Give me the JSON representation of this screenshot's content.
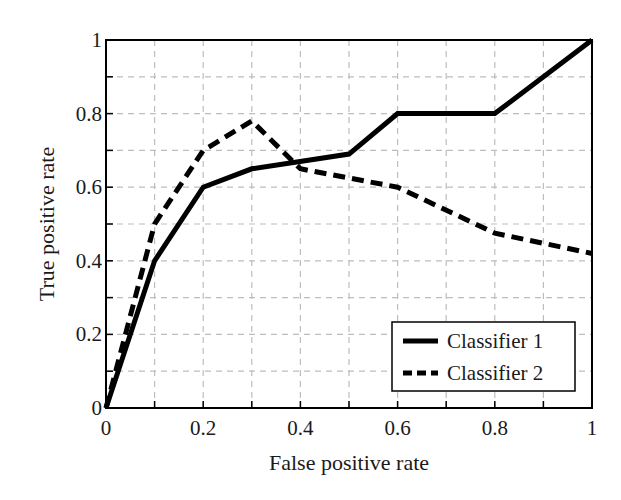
{
  "chart_data": {
    "type": "line",
    "title": "",
    "xlabel": "False positive rate",
    "ylabel": "True positive rate",
    "xlim": [
      0,
      1
    ],
    "ylim": [
      0,
      1
    ],
    "grid": true,
    "grid_step": 0.1,
    "legend_position": "lower right",
    "xticks": [
      0,
      0.2,
      0.4,
      0.6,
      0.8,
      1
    ],
    "xtick_labels": [
      "0",
      "0.2",
      "0.4",
      "0.6",
      "0.8",
      "1"
    ],
    "yticks": [
      0,
      0.2,
      0.4,
      0.6,
      0.8,
      1
    ],
    "ytick_labels": [
      "0",
      "0.2",
      "0.4",
      "0.6",
      "0.8",
      "1"
    ],
    "series": [
      {
        "name": "Classifier 1",
        "style": "solid",
        "color": "#000000",
        "x": [
          0,
          0.1,
          0.2,
          0.3,
          0.5,
          0.6,
          0.8,
          1.0
        ],
        "y": [
          0,
          0.4,
          0.6,
          0.65,
          0.69,
          0.8,
          0.8,
          1.0
        ]
      },
      {
        "name": "Classifier 2",
        "style": "dashed",
        "color": "#000000",
        "x": [
          0,
          0.1,
          0.2,
          0.3,
          0.4,
          0.5,
          0.6,
          0.8,
          1.0
        ],
        "y": [
          0,
          0.5,
          0.7,
          0.78,
          0.65,
          0.625,
          0.6,
          0.475,
          0.42
        ]
      }
    ]
  },
  "colors": {
    "axis": "#000000",
    "grid": "#bdbdbd",
    "background": "#ffffff"
  }
}
